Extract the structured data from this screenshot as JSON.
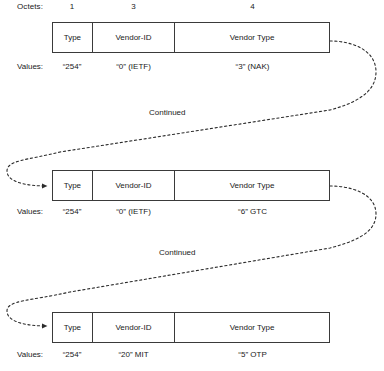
{
  "diagram": {
    "row_labels": {
      "octets": "Octets:",
      "values": "Values:"
    },
    "octet_counts": [
      "1",
      "3",
      "4"
    ],
    "field_names": {
      "type": "Type",
      "vendor_id": "Vendor-ID",
      "vendor_type": "Vendor Type"
    },
    "continued_label": "Continued",
    "rows": [
      {
        "fields": [
          "Type",
          "Vendor-ID",
          "Vendor Type"
        ],
        "values": [
          "“254”",
          "“0” (IETF)",
          "“3” (NAK)"
        ]
      },
      {
        "fields": [
          "Type",
          "Vendor-ID",
          "Vendor Type"
        ],
        "values": [
          "“254”",
          "“0” (IETF)",
          "“6” GTC"
        ]
      },
      {
        "fields": [
          "Type",
          "Vendor-ID",
          "Vendor Type"
        ],
        "values": [
          "“254”",
          "“20” MIT",
          "“5” OTP"
        ]
      }
    ],
    "connectors": [
      {
        "label": "Continued",
        "from_row": 1,
        "to_row": 2
      },
      {
        "label": "Continued",
        "from_row": 2,
        "to_row": 3
      }
    ],
    "colors": {
      "stroke": "#3a3a3a",
      "text": "#1a1a1a",
      "background": "#ffffff"
    }
  }
}
